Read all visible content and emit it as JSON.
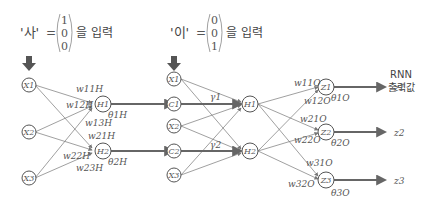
{
  "input1": {
    "char": "'사'",
    "eq": "=",
    "vector": [
      "1",
      "0",
      "0"
    ],
    "suffix": "을 입력"
  },
  "input2": {
    "char": "'이'",
    "eq": "=",
    "vector": [
      "0",
      "0",
      "1"
    ],
    "suffix": "을 입력"
  },
  "output_title": {
    "line1": "RNN",
    "line2": "출력값"
  },
  "nodes": {
    "x_left": [
      "X1",
      "X2",
      "X3"
    ],
    "h_left": [
      "H1",
      "H2"
    ],
    "x_right": [
      "X1",
      "X2",
      "X3"
    ],
    "c_right": [
      "C1",
      "C2"
    ],
    "h_right": [
      "H1",
      "H2"
    ],
    "z": [
      "Z1",
      "Z2",
      "Z3"
    ]
  },
  "labels": {
    "w_hidden": [
      "w11H",
      "w12H",
      "w13H",
      "w21H",
      "w22H",
      "w23H"
    ],
    "theta_hidden": [
      "θ1H",
      "θ2H"
    ],
    "gamma": [
      "γ1",
      "γ2"
    ],
    "w_out": [
      "w11O",
      "w12O",
      "w21O",
      "w22O",
      "w31O",
      "w32O"
    ],
    "theta_out": [
      "θ1O",
      "θ2O",
      "θ3O"
    ],
    "outputs": [
      "z1",
      "z2",
      "z3"
    ]
  },
  "colors": {
    "arrow_fill": "#555555",
    "line": "#777777",
    "text": "#555555"
  }
}
